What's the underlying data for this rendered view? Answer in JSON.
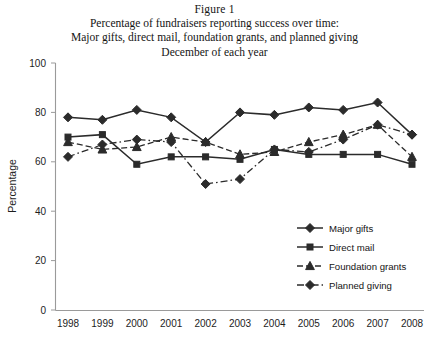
{
  "title": {
    "line1": "Figure 1",
    "line2": "Percentage of fundraisers reporting success over time:",
    "line3": "Major gifts, direct mail, foundation grants, and planned giving",
    "line4": "December of each year"
  },
  "axes": {
    "ylabel": "Percentage",
    "y_ticks": [
      "0",
      "20",
      "40",
      "60",
      "80",
      "100"
    ],
    "x_ticks": [
      "1998",
      "1999",
      "2000",
      "2001",
      "2002",
      "2003",
      "2004",
      "2005",
      "2006",
      "2007",
      "2008"
    ]
  },
  "legend": {
    "position": "inside-lower-right",
    "entries": [
      {
        "label": "Major gifts",
        "marker": "diamond",
        "dash": "solid"
      },
      {
        "label": "Direct mail",
        "marker": "square",
        "dash": "solid"
      },
      {
        "label": "Foundation grants",
        "marker": "triangle",
        "dash": "dashed"
      },
      {
        "label": "Planned giving",
        "marker": "diamond",
        "dash": "dash-dot"
      }
    ]
  },
  "chart_data": {
    "type": "line",
    "xlabel": "",
    "ylabel": "Percentage",
    "x": [
      "1998",
      "1999",
      "2000",
      "2001",
      "2002",
      "2003",
      "2004",
      "2005",
      "2006",
      "2007",
      "2008"
    ],
    "ylim": [
      0,
      100
    ],
    "ytick_step": 20,
    "grid": false,
    "legend_position": "inside-lower-right",
    "series": [
      {
        "name": "Major gifts",
        "marker": "diamond",
        "dash": "solid",
        "color": "#2b2b2b",
        "values": [
          78,
          77,
          81,
          78,
          68,
          80,
          79,
          82,
          81,
          84,
          71
        ]
      },
      {
        "name": "Direct mail",
        "marker": "square",
        "dash": "solid",
        "color": "#2b2b2b",
        "values": [
          70,
          71,
          59,
          62,
          62,
          61,
          65,
          63,
          63,
          63,
          59
        ]
      },
      {
        "name": "Foundation grants",
        "marker": "triangle",
        "dash": "dashed",
        "color": "#2b2b2b",
        "values": [
          68,
          65,
          66,
          70,
          68,
          63,
          64,
          68,
          71,
          75,
          62
        ]
      },
      {
        "name": "Planned giving",
        "marker": "diamond",
        "dash": "dash-dot",
        "color": "#2b2b2b",
        "values": [
          62,
          67,
          69,
          68,
          51,
          53,
          65,
          64,
          69,
          75,
          71
        ]
      }
    ]
  }
}
